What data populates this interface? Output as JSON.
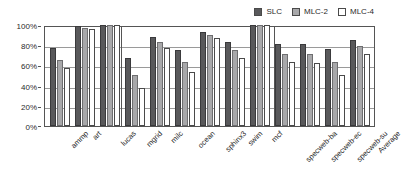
{
  "chart_data": {
    "type": "bar",
    "title": "",
    "subtitle": "",
    "xlabel": "",
    "ylabel": "",
    "ylim": [
      0,
      100
    ],
    "yticks": [
      "0%",
      "20%",
      "40%",
      "60%",
      "80%",
      "100%"
    ],
    "ytick_values": [
      0,
      20,
      40,
      60,
      80,
      100
    ],
    "grid": true,
    "legend_position": "top-right",
    "categories": [
      "ammp",
      "art",
      "lucas",
      "mgrid",
      "milc",
      "ocean",
      "sphinx3",
      "swim",
      "mcf",
      "specweb-ba",
      "specweb-ec",
      "specweb-su",
      "Average"
    ],
    "series": [
      {
        "name": "SLC",
        "color": "#59595b",
        "values": [
          77,
          99,
          100,
          67,
          88,
          75,
          93,
          83,
          100,
          81,
          81,
          76,
          85
        ]
      },
      {
        "name": "MLC-2",
        "color": "#a8a8aa",
        "values": [
          65,
          97,
          100,
          51,
          83,
          63,
          90,
          75,
          100,
          71,
          71,
          63,
          79
        ]
      },
      {
        "name": "MLC-4",
        "color": "#ffffff",
        "values": [
          57,
          96,
          100,
          38,
          77,
          53,
          87,
          67,
          100,
          63,
          62,
          51,
          71
        ]
      }
    ],
    "group_separators_after": [
      "lucas",
      "mcf"
    ]
  }
}
